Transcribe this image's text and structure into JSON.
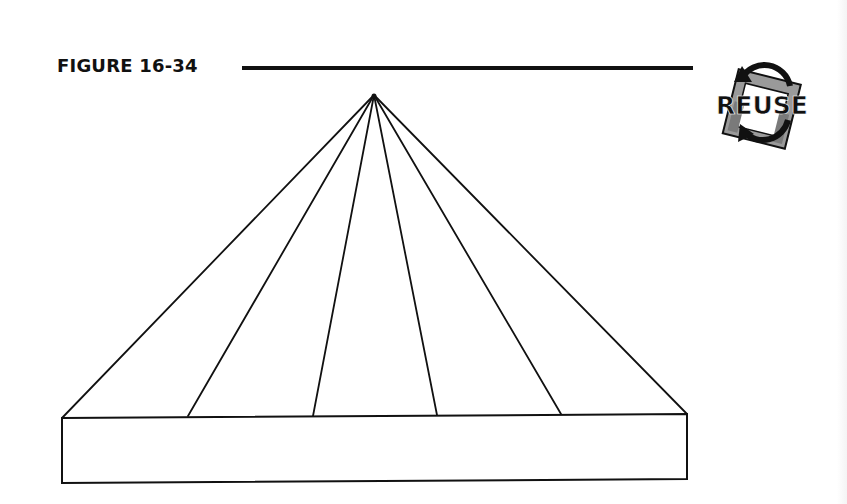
{
  "figure": {
    "label": "FIGURE 16-34",
    "badge_text": "REUSE",
    "colors": {
      "ink": "#111111",
      "paper": "#ffffff",
      "badge_gray": "#8a8a8a"
    }
  },
  "diagram": {
    "type": "fan-pyramid-on-base",
    "apex": [
      374,
      95
    ],
    "fan_line_bottoms": [
      [
        62,
        418
      ],
      [
        188,
        416
      ],
      [
        313,
        416
      ],
      [
        437,
        415
      ],
      [
        561,
        414
      ],
      [
        687,
        414
      ]
    ],
    "base_box": {
      "top_left": [
        62,
        418
      ],
      "top_right": [
        687,
        414
      ],
      "bottom_right": [
        687,
        479
      ],
      "bottom_left": [
        62,
        483
      ]
    }
  }
}
